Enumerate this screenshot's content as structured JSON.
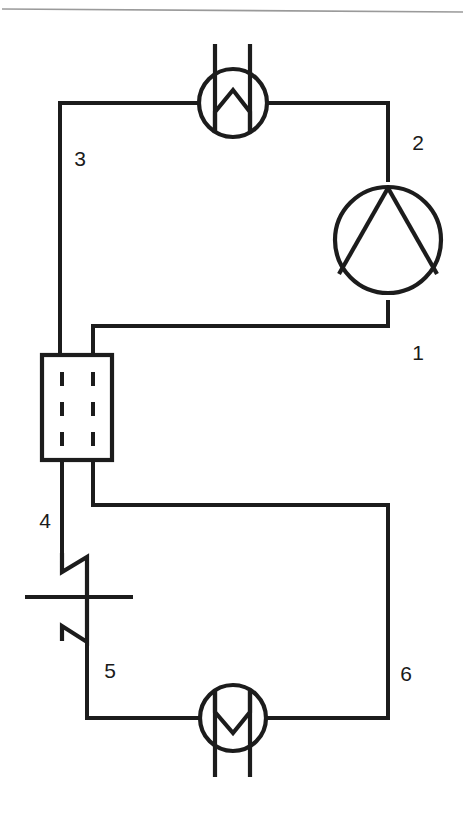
{
  "figure": {
    "kind": "process-flow-diagram",
    "background_color": "#ffffff",
    "line_color": "#1c1c1c",
    "rule_color": "#9a9a9a"
  },
  "top_rule": {
    "name": "page-divider-rule",
    "x1": 2,
    "y1": 9,
    "x2": 463,
    "y2": 12
  },
  "state_labels": [
    {
      "id": "1",
      "text": "1",
      "x": 418,
      "y": 360
    },
    {
      "id": "2",
      "text": "2",
      "x": 418,
      "y": 150
    },
    {
      "id": "3",
      "text": "3",
      "x": 75,
      "y": 166
    },
    {
      "id": "4",
      "text": "4",
      "x": 42,
      "y": 528
    },
    {
      "id": "5",
      "text": "5",
      "x": 105,
      "y": 678
    },
    {
      "id": "6",
      "text": "6",
      "x": 402,
      "y": 681
    }
  ],
  "devices": {
    "condenser": {
      "label": "condenser",
      "glyph": "W-in-circle",
      "cx": 233,
      "cy": 103,
      "r": 34,
      "riser_x1": 215,
      "riser_x2": 250,
      "riser_top": 44,
      "port_left_x": 60,
      "port_right_x": 390,
      "port_y": 103
    },
    "compressor": {
      "label": "compressor",
      "glyph": "circle-with-two-chords",
      "cx": 388,
      "cy": 240,
      "r": 53,
      "stem_top_y": 182,
      "stem_bottom_y": 300
    },
    "internal_heat_exchanger": {
      "label": "internal-heat-exchanger",
      "glyph": "rectangle-with-dashed-tubes",
      "x": 42,
      "y": 355,
      "width": 70,
      "height": 105,
      "dash_x_left": 62,
      "dash_x_right": 93,
      "dash_top": 372,
      "dash_bottom": 444
    },
    "expansion_valve": {
      "label": "expansion-valve",
      "glyph": "throttle-bowtie",
      "cx": 74,
      "cy": 597,
      "stem_x_in": 62,
      "stem_x_out": 87,
      "top_y": 553,
      "bottom_y": 645,
      "cross_x1": 25,
      "cross_x2": 133,
      "cross_y": 597
    },
    "evaporator": {
      "label": "evaporator",
      "glyph": "M-in-circle",
      "cx": 233,
      "cy": 718,
      "r": 33,
      "downcomer_x1": 215,
      "downcomer_x2": 250,
      "downcomer_bottom": 777,
      "port_left_x": 87,
      "port_right_x": 388,
      "port_y": 718
    }
  },
  "pipe_runs": [
    {
      "name": "pipe-2-compressor-to-condenser",
      "from": "compressor-top",
      "d": "M 388 182 L 388 103 L 267 103"
    },
    {
      "name": "pipe-3-condenser-to-hx",
      "from": "condenser-left",
      "d": "M 199 103 L 60 103 L 60 355"
    },
    {
      "name": "pipe-4-hx-to-valve",
      "from": "hx-bottom-left",
      "d": "M 62 460 L 62 553"
    },
    {
      "name": "pipe-5-valve-to-evaporator",
      "from": "valve-bottom",
      "d": "M 87 645 L 87 718 L 200 718"
    },
    {
      "name": "pipe-6-evaporator-to-hx",
      "from": "evaporator-right",
      "d": "M 266 718 L 388 718 L 388 505 L 93 505 L 93 460"
    },
    {
      "name": "pipe-1-hx-to-compressor",
      "from": "hx-top-right",
      "d": "M 93 355 L 93 326 L 388 326 L 388 300"
    }
  ]
}
